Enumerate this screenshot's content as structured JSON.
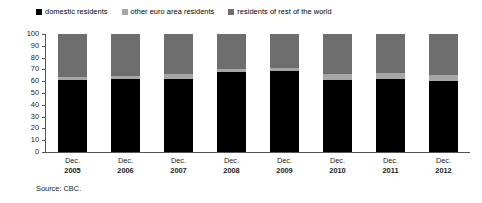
{
  "chart_data": {
    "type": "bar",
    "subtype": "stacked-bar-100-percent",
    "title": "",
    "xlabel": "",
    "ylabel": "",
    "ylim": [
      0,
      100
    ],
    "yticks": [
      0,
      10,
      20,
      30,
      40,
      50,
      60,
      70,
      80,
      90,
      100
    ],
    "grid": false,
    "legend_position": "top-left",
    "categories": [
      "Dec. 2005",
      "Dec. 2006",
      "Dec. 2007",
      "Dec. 2008",
      "Dec. 2009",
      "Dec. 2010",
      "Dec. 2011",
      "Dec. 2012"
    ],
    "category_months": [
      "Dec.",
      "Dec.",
      "Dec.",
      "Dec.",
      "Dec.",
      "Dec.",
      "Dec.",
      "Dec."
    ],
    "category_years": [
      "2005",
      "2006",
      "2007",
      "2008",
      "2009",
      "2010",
      "2011",
      "2012"
    ],
    "series": [
      {
        "name": "domestic residents",
        "color": "#000000",
        "values": [
          61,
          62,
          62,
          68,
          69,
          61,
          62,
          60
        ]
      },
      {
        "name": "other euro area residents",
        "color": "#a6a6a6",
        "values": [
          3,
          2,
          4,
          2,
          2,
          5,
          5,
          5
        ]
      },
      {
        "name": "residents of rest of the world",
        "color": "#6e6e6e",
        "values": [
          36,
          36,
          34,
          30,
          29,
          34,
          33,
          35
        ]
      }
    ]
  },
  "legend": {
    "items": [
      {
        "label": "domestic residents",
        "color": "#000000"
      },
      {
        "label": "other euro area residents",
        "color": "#a6a6a6"
      },
      {
        "label": "residents of rest of the world",
        "color": "#6e6e6e"
      }
    ]
  },
  "axis": {
    "y_ticks": [
      "100",
      "90",
      "80",
      "70",
      "60",
      "50",
      "40",
      "30",
      "20",
      "10",
      "0"
    ]
  },
  "source": {
    "text": "Source: CBC."
  }
}
